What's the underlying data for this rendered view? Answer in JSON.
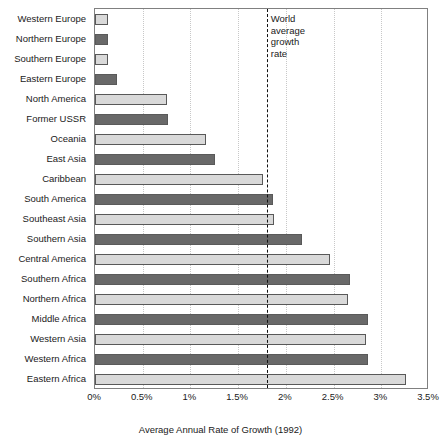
{
  "chart_data": {
    "type": "bar",
    "orientation": "horizontal",
    "title": "",
    "xlabel": "Average Annual Rate of Growth (1992)",
    "ylabel": "",
    "xlim": [
      0,
      3.5
    ],
    "xtick_labels": [
      "0%",
      "0.5%",
      "1%",
      "1.5%",
      "2%",
      "2.5%",
      "3%",
      "3.5%"
    ],
    "xtick_values": [
      0,
      0.5,
      1,
      1.5,
      2,
      2.5,
      3,
      3.5
    ],
    "grid": "vertical-dotted",
    "legend": "none",
    "categories": [
      "Western Europe",
      "Northern Europe",
      "Southern Europe",
      "Eastern Europe",
      "North America",
      "Former USSR",
      "Oceania",
      "East Asia",
      "Caribbean",
      "South America",
      "Southeast Asia",
      "Southern Asia",
      "Central America",
      "Southern Africa",
      "Northern Africa",
      "Middle Africa",
      "Western Asia",
      "Western Africa",
      "Eastern Africa"
    ],
    "values": [
      0.14,
      0.14,
      0.14,
      0.23,
      0.75,
      0.77,
      1.16,
      1.26,
      1.76,
      1.87,
      1.88,
      2.17,
      2.46,
      2.67,
      2.65,
      2.86,
      2.84,
      2.86,
      3.26
    ],
    "bar_fills": [
      "light",
      "dark",
      "light",
      "dark",
      "light",
      "dark",
      "light",
      "dark",
      "light",
      "dark",
      "light",
      "dark",
      "light",
      "dark",
      "light",
      "dark",
      "light",
      "dark",
      "light"
    ],
    "annotations": [
      {
        "name": "world-average-growth-rate",
        "value": 1.8,
        "label_lines": [
          "World",
          "average",
          "growth",
          "rate"
        ],
        "style": "dashed-vertical-line"
      }
    ],
    "colors": {
      "bar_light": "#d9d9d9",
      "bar_dark": "#696969",
      "bar_outline": "#595959",
      "gridline": "#c8c8c8",
      "axis": "#808080",
      "annotation_line": "#111111",
      "text": "#1a1a1a"
    }
  }
}
